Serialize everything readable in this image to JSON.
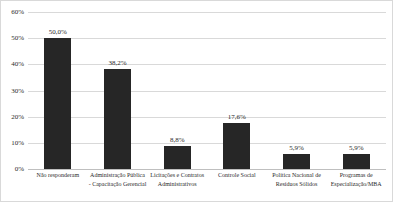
{
  "chart_data": {
    "type": "bar",
    "title": "",
    "subtitle": "",
    "xlabel": "",
    "ylabel": "",
    "ylim": [
      0,
      60
    ],
    "ytick_labels": [
      "60%",
      "50%",
      "40%",
      "30%",
      "20%",
      "10%",
      "0%"
    ],
    "ytick_values": [
      60,
      50,
      40,
      30,
      20,
      10,
      0
    ],
    "grid": true,
    "legend": false,
    "legend_position": "none",
    "bar_color": "#262626",
    "gridline_color": "#d9d9d9",
    "frame_color": "#d9d9d9",
    "categories": [
      "Não responderam",
      "Administração Pública - Capacitação Gerencial",
      "Licitações e Contratos Administrativos",
      "Controle Social",
      "Política Nacional de Resíduos Sólidos",
      "Programas de Especialização/MBA"
    ],
    "values": [
      50.0,
      38.2,
      8.8,
      17.6,
      5.9,
      5.9
    ],
    "value_labels": [
      "50,0%",
      "38,2%",
      "8,8%",
      "17,6%",
      "5,9%",
      "5,9%"
    ]
  }
}
